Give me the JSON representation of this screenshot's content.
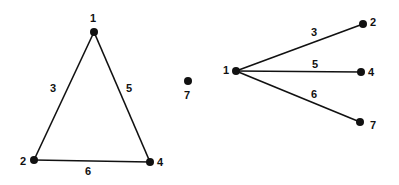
{
  "graphs": [
    {
      "name": "left-graph",
      "nodes": [
        {
          "id": "1",
          "x": 94,
          "y": 32,
          "lx": 93,
          "ly": 19
        },
        {
          "id": "2",
          "x": 34,
          "y": 160,
          "lx": 23,
          "ly": 162
        },
        {
          "id": "4",
          "x": 150,
          "y": 162,
          "lx": 160,
          "ly": 163
        },
        {
          "id": "7",
          "x": 188,
          "y": 81,
          "lx": 187,
          "ly": 96
        }
      ],
      "edges": [
        {
          "from": "1",
          "to": "2",
          "weight": "3",
          "lx": 53,
          "ly": 89
        },
        {
          "from": "1",
          "to": "4",
          "weight": "5",
          "lx": 129,
          "ly": 89
        },
        {
          "from": "2",
          "to": "4",
          "weight": "6",
          "lx": 88,
          "ly": 172
        }
      ]
    },
    {
      "name": "right-graph",
      "nodes": [
        {
          "id": "1",
          "x": 236,
          "y": 71,
          "lx": 226,
          "ly": 71
        },
        {
          "id": "2",
          "x": 363,
          "y": 24,
          "lx": 373,
          "ly": 23
        },
        {
          "id": "4",
          "x": 361,
          "y": 72,
          "lx": 371,
          "ly": 73
        },
        {
          "id": "7",
          "x": 360,
          "y": 122,
          "lx": 373,
          "ly": 126
        }
      ],
      "edges": [
        {
          "from": "1",
          "to": "2",
          "weight": "3",
          "lx": 314,
          "ly": 33
        },
        {
          "from": "1",
          "to": "4",
          "weight": "5",
          "lx": 315,
          "ly": 65
        },
        {
          "from": "1",
          "to": "7",
          "weight": "6",
          "lx": 314,
          "ly": 95
        }
      ]
    }
  ]
}
